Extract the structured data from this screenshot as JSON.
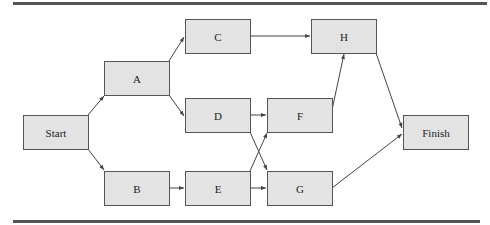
{
  "diagram": {
    "type": "activity-network",
    "colors": {
      "node_fill": "#e3e3e3",
      "node_border": "#555555",
      "edge": "#444444",
      "rule": "#555555"
    },
    "nodes": [
      {
        "id": "start",
        "label": "Start",
        "x": 23,
        "y": 115
      },
      {
        "id": "a",
        "label": "A",
        "x": 104,
        "y": 61
      },
      {
        "id": "b",
        "label": "B",
        "x": 104,
        "y": 171
      },
      {
        "id": "c",
        "label": "C",
        "x": 185,
        "y": 19
      },
      {
        "id": "d",
        "label": "D",
        "x": 185,
        "y": 98
      },
      {
        "id": "e",
        "label": "E",
        "x": 185,
        "y": 171
      },
      {
        "id": "f",
        "label": "F",
        "x": 267,
        "y": 98
      },
      {
        "id": "g",
        "label": "G",
        "x": 267,
        "y": 171
      },
      {
        "id": "h",
        "label": "H",
        "x": 311,
        "y": 19
      },
      {
        "id": "finish",
        "label": "Finish",
        "x": 403,
        "y": 115
      }
    ],
    "edges": [
      {
        "from": "Start",
        "to": "A"
      },
      {
        "from": "Start",
        "to": "B"
      },
      {
        "from": "A",
        "to": "C"
      },
      {
        "from": "A",
        "to": "D"
      },
      {
        "from": "B",
        "to": "E"
      },
      {
        "from": "C",
        "to": "H"
      },
      {
        "from": "D",
        "to": "F"
      },
      {
        "from": "D",
        "to": "G"
      },
      {
        "from": "E",
        "to": "F"
      },
      {
        "from": "E",
        "to": "G"
      },
      {
        "from": "F",
        "to": "H"
      },
      {
        "from": "H",
        "to": "Finish"
      },
      {
        "from": "G",
        "to": "Finish"
      }
    ]
  }
}
